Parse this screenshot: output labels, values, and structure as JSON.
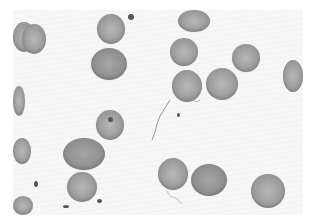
{
  "image": {
    "subject": "blood smear micrograph",
    "description": "Grayscale microscope image of red blood cells scattered on a light background with a few small dark specks and thin fibrous strands",
    "colors": {
      "background": "#f7f7f7",
      "cell": "#a2a2a2",
      "speck": "#555555"
    },
    "cells": [
      {
        "x": 13,
        "y": 22,
        "w": 22,
        "h": 30,
        "dark": false
      },
      {
        "x": 22,
        "y": 24,
        "w": 24,
        "h": 30,
        "dark": false
      },
      {
        "x": 97,
        "y": 14,
        "w": 28,
        "h": 30,
        "dark": false
      },
      {
        "x": 91,
        "y": 48,
        "w": 36,
        "h": 32,
        "dark": true
      },
      {
        "x": 178,
        "y": 10,
        "w": 32,
        "h": 22,
        "dark": false
      },
      {
        "x": 170,
        "y": 38,
        "w": 28,
        "h": 28,
        "dark": false
      },
      {
        "x": 232,
        "y": 44,
        "w": 28,
        "h": 28,
        "dark": false
      },
      {
        "x": 283,
        "y": 60,
        "w": 20,
        "h": 32,
        "dark": false
      },
      {
        "x": 172,
        "y": 70,
        "w": 30,
        "h": 32,
        "dark": false
      },
      {
        "x": 206,
        "y": 68,
        "w": 32,
        "h": 32,
        "dark": false
      },
      {
        "x": 13,
        "y": 86,
        "w": 12,
        "h": 30,
        "dark": false
      },
      {
        "x": 96,
        "y": 110,
        "w": 28,
        "h": 30,
        "dark": false
      },
      {
        "x": 13,
        "y": 138,
        "w": 18,
        "h": 26,
        "dark": false
      },
      {
        "x": 63,
        "y": 138,
        "w": 42,
        "h": 32,
        "dark": true
      },
      {
        "x": 67,
        "y": 172,
        "w": 30,
        "h": 30,
        "dark": false
      },
      {
        "x": 13,
        "y": 196,
        "w": 20,
        "h": 19,
        "dark": false
      },
      {
        "x": 158,
        "y": 158,
        "w": 30,
        "h": 32,
        "dark": false
      },
      {
        "x": 191,
        "y": 164,
        "w": 36,
        "h": 32,
        "dark": true
      },
      {
        "x": 251,
        "y": 174,
        "w": 34,
        "h": 34,
        "dark": false
      }
    ],
    "specks": [
      {
        "x": 128,
        "y": 14,
        "w": 6,
        "h": 6
      },
      {
        "x": 108,
        "y": 117,
        "w": 5,
        "h": 5
      },
      {
        "x": 34,
        "y": 181,
        "w": 4,
        "h": 6
      },
      {
        "x": 63,
        "y": 205,
        "w": 6,
        "h": 3
      },
      {
        "x": 97,
        "y": 199,
        "w": 5,
        "h": 4
      },
      {
        "x": 177,
        "y": 113,
        "w": 3,
        "h": 4
      }
    ]
  }
}
